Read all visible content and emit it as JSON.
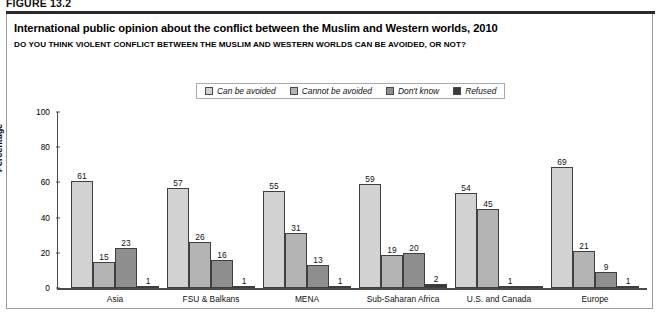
{
  "figure": {
    "label": "FIGURE 13.2"
  },
  "header": {
    "title": "International public opinion about the conflict between the Muslim and Western worlds, 2010",
    "subtitle": "DO YOU THINK VIOLENT CONFLICT BETWEEN THE MUSLIM AND WESTERN WORLDS CAN BE AVOIDED, OR NOT?"
  },
  "colors": {
    "series_can_be_avoided": "#d2d2d2",
    "series_cannot_be_avoided": "#b4b4b4",
    "series_dont_know": "#8e8e8e",
    "series_refused": "#3a3a3a",
    "axis": "#4a4a4a",
    "panel_border": "#9a9a9a",
    "rule": "#2b2b2b"
  },
  "chart_data": {
    "type": "bar",
    "title": "International public opinion about the conflict between the Muslim and Western worlds, 2010",
    "subtitle": "DO YOU THINK VIOLENT CONFLICT BETWEEN THE MUSLIM AND WESTERN WORLDS CAN BE AVOIDED, OR NOT?",
    "xlabel": "",
    "ylabel": "Percentage",
    "ylim": [
      0,
      100
    ],
    "yticks": [
      0,
      20,
      40,
      60,
      80,
      100
    ],
    "grid": false,
    "legend_position": "top-center",
    "categories": [
      "Asia",
      "FSU & Balkans",
      "MENA",
      "Sub-Saharan Africa",
      "U.S. and Canada",
      "Europe"
    ],
    "series": [
      {
        "name": "Can be avoided",
        "color": "#d2d2d2",
        "values": [
          61,
          57,
          55,
          59,
          54,
          69
        ],
        "labels": [
          "61",
          "57",
          "55",
          "59",
          "54",
          "69"
        ]
      },
      {
        "name": "Cannot be avoided",
        "color": "#b4b4b4",
        "values": [
          15,
          26,
          31,
          19,
          45,
          21
        ],
        "labels": [
          "15",
          "26",
          "31",
          "19",
          "45",
          "21"
        ]
      },
      {
        "name": "Don't know",
        "color": "#8e8e8e",
        "values": [
          23,
          16,
          13,
          20,
          1,
          9
        ],
        "labels": [
          "23",
          "16",
          "13",
          "20",
          "1",
          "9"
        ]
      },
      {
        "name": "Refused",
        "color": "#3a3a3a",
        "values": [
          1,
          1,
          1,
          2,
          0,
          1
        ],
        "labels": [
          "1",
          "1",
          "1",
          "2",
          "",
          "1"
        ]
      }
    ]
  }
}
